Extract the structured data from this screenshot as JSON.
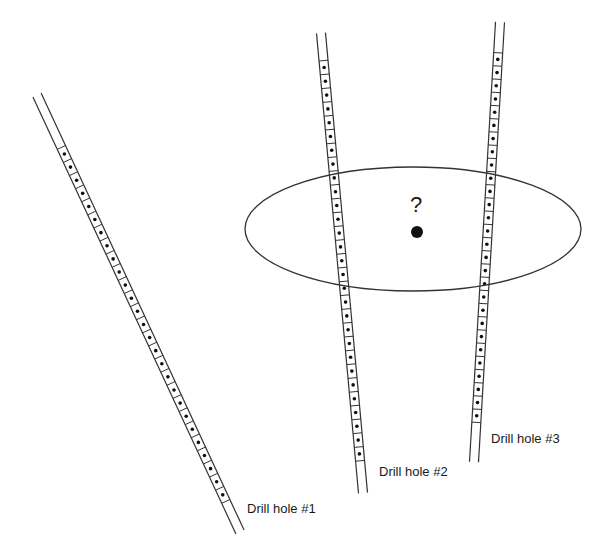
{
  "diagram": {
    "stroke_color": "#333333",
    "dot_color": "#111111",
    "target_ellipse": {
      "cx": 413,
      "cy": 229,
      "rx": 168,
      "ry": 62
    },
    "unknown_point": {
      "x": 417,
      "y": 232,
      "r": 6,
      "label": "?"
    },
    "drill_holes": [
      {
        "label": "Drill hole #1",
        "top": [
          37,
          95
        ],
        "bottom": [
          240,
          532
        ],
        "label_pos": [
          247,
          502
        ],
        "samples_start": 0.12,
        "samples_end": 0.93,
        "sample_count": 27
      },
      {
        "label": "Drill hole #2",
        "top": [
          321,
          33
        ],
        "bottom": [
          363,
          493
        ],
        "label_pos": [
          379,
          465
        ],
        "samples_start": 0.06,
        "samples_end": 0.93,
        "sample_count": 29
      },
      {
        "label": "Drill hole #3",
        "top": [
          500,
          22
        ],
        "bottom": [
          474,
          462
        ],
        "label_pos": [
          491,
          432
        ],
        "samples_start": 0.07,
        "samples_end": 0.91,
        "sample_count": 28
      }
    ]
  }
}
